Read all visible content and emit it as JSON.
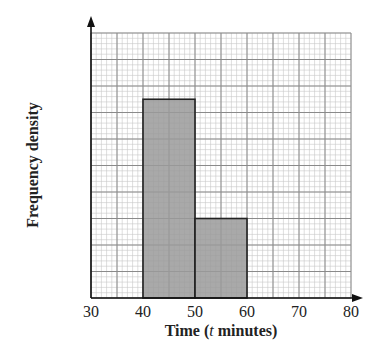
{
  "chart_data": {
    "type": "bar",
    "subtype": "histogram",
    "title": "",
    "xlabel": "Time (t minutes)",
    "xlabel_parts": {
      "prefix": "Time (",
      "var": "t",
      "suffix": " minutes)"
    },
    "ylabel": "Frequency density",
    "x_ticks": [
      30,
      40,
      50,
      60,
      70,
      80
    ],
    "xlim": [
      30,
      80
    ],
    "ylim_grid_units": [
      0,
      10
    ],
    "y_ticks": [],
    "grid": true,
    "grid_major_x_step": 5,
    "grid_minor_per_major": 5,
    "legend": null,
    "bins": [
      {
        "from": 40,
        "to": 50,
        "height_grid_units": 7.5
      },
      {
        "from": 50,
        "to": 60,
        "height_grid_units": 3
      }
    ],
    "categories": [
      "40-50",
      "50-60"
    ],
    "values": [
      7.5,
      3
    ],
    "colors": {
      "bar_fill": "#9a9a9a",
      "bar_stroke": "#222222",
      "grid_major": "#8a8a8a",
      "grid_minor": "#c8c8c8",
      "axis": "#111111"
    }
  }
}
